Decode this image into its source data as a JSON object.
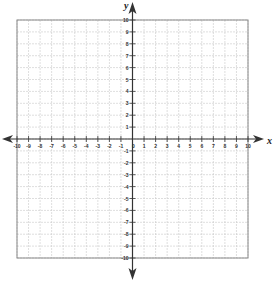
{
  "chart_data": {
    "type": "coordinate-grid",
    "title": "",
    "xlabel": "x",
    "ylabel": "y",
    "xlim": [
      -10,
      10
    ],
    "ylim": [
      -10,
      10
    ],
    "grid": true,
    "x_ticks": [
      -10,
      -9,
      -8,
      -7,
      -6,
      -5,
      -4,
      -3,
      -2,
      -1,
      1,
      2,
      3,
      4,
      5,
      6,
      7,
      8,
      9,
      10
    ],
    "y_ticks": [
      -10,
      -9,
      -8,
      -7,
      -6,
      -5,
      -4,
      -3,
      -2,
      -1,
      1,
      2,
      3,
      4,
      5,
      6,
      7,
      8,
      9,
      10
    ],
    "origin_label": "0",
    "series": []
  },
  "colors": {
    "grid": "#c8c8c8",
    "border": "#888888",
    "axis": "#333333"
  }
}
